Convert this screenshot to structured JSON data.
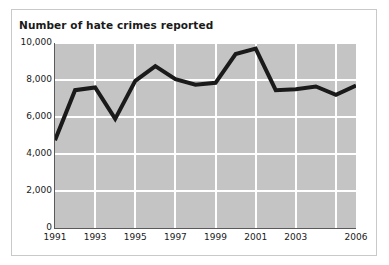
{
  "chart_data": {
    "type": "line",
    "title": "Number of hate crimes reported",
    "xlabel": "",
    "ylabel": "",
    "x": [
      1991,
      1992,
      1993,
      1994,
      1995,
      1996,
      1997,
      1998,
      1999,
      2000,
      2001,
      2002,
      2003,
      2004,
      2005,
      2006
    ],
    "values": [
      4750,
      7450,
      7600,
      5900,
      7950,
      8750,
      8050,
      7750,
      7850,
      9400,
      9700,
      7450,
      7500,
      7650,
      7200,
      7700
    ],
    "series": [
      {
        "name": "Number of hate crimes reported",
        "values": [
          4750,
          7450,
          7600,
          5900,
          7950,
          8750,
          8050,
          7750,
          7850,
          9400,
          9700,
          7450,
          7500,
          7650,
          7200,
          7700
        ]
      }
    ],
    "xlim": [
      1991,
      2006
    ],
    "ylim": [
      0,
      10000
    ],
    "y_ticks": [
      0,
      2000,
      4000,
      6000,
      8000,
      10000
    ],
    "y_tick_labels": [
      "0",
      "2,000",
      "4,000",
      "6,000",
      "8,000",
      "10,000"
    ],
    "x_ticks": [
      1991,
      1993,
      1995,
      1997,
      1999,
      2001,
      2003,
      2006
    ],
    "x_tick_labels": [
      "1991",
      "1993",
      "1995",
      "1997",
      "1999",
      "2001",
      "2003",
      "2006"
    ],
    "grid": true,
    "grid_color": "#ffffff",
    "plot_background": "#c4c4c4",
    "line_color": "#1a1a1a",
    "line_width": 4,
    "legend": false,
    "legend_position": "none"
  }
}
